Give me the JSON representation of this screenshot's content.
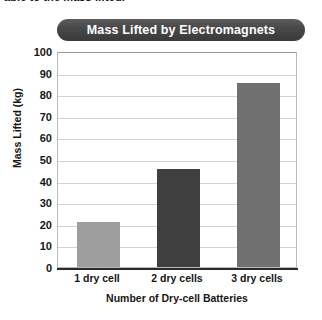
{
  "page": {
    "cropped_top_text": "able to the mass lifted."
  },
  "chart_data": {
    "type": "bar",
    "title": "Mass Lifted by Electromagnets",
    "categories": [
      "1 dry cell",
      "2 dry cells",
      "3 dry cells"
    ],
    "values": [
      21,
      45.5,
      85
    ],
    "xlabel": "Number of Dry-cell Batteries",
    "ylabel": "Mass Lifted (kg)",
    "ylim": [
      0,
      100
    ],
    "yticks": [
      0,
      10,
      20,
      30,
      40,
      50,
      60,
      70,
      80,
      90,
      100
    ],
    "ytick_labels": [
      "0",
      "10",
      "20",
      "30",
      "40",
      "50",
      "60",
      "70",
      "80",
      "90",
      "100"
    ],
    "grid": true,
    "legend": null,
    "bar_colors": [
      "#9e9e9e",
      "#3f3f3f",
      "#707070"
    ],
    "title_banner_color": "#484848",
    "title_text_color": "#ffffff"
  }
}
